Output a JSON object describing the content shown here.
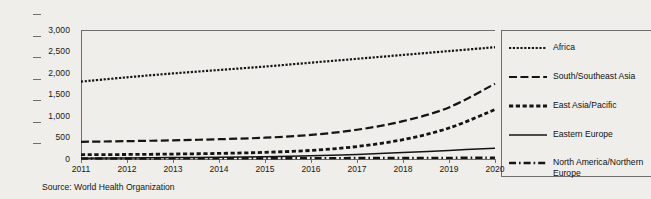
{
  "source_note": "Source: World Health Organization",
  "legend": {
    "items": [
      {
        "label": "Africa",
        "style": "fine-dotted"
      },
      {
        "label": "South/Southeast Asia",
        "style": "long-dashed"
      },
      {
        "label": "East Asia/Pacific",
        "style": "square-dashed"
      },
      {
        "label": "Eastern Europe",
        "style": "solid"
      },
      {
        "label": "North America/Northern\nEurope",
        "style": "dash-dot"
      }
    ]
  },
  "chart_data": {
    "type": "line",
    "title": "",
    "xlabel": "",
    "ylabel": "",
    "grid": false,
    "legend_position": "right",
    "x": [
      2011,
      2012,
      2013,
      2014,
      2015,
      2016,
      2017,
      2018,
      2019,
      2020
    ],
    "xtick_labels": [
      "2011",
      "2012",
      "2013",
      "2014",
      "2015",
      "2016",
      "2017",
      "2018",
      "2019",
      "2020"
    ],
    "ytick_labels": [
      "0",
      "500",
      "1,000",
      "1,500",
      "2,000",
      "2,500",
      "3,000"
    ],
    "ytick_values": [
      0,
      500,
      1000,
      1500,
      2000,
      2500,
      3000
    ],
    "ylim": [
      0,
      3000
    ],
    "xlim": [
      2011,
      2020
    ],
    "series": [
      {
        "name": "Africa",
        "style": "fine-dotted",
        "values": [
          1800,
          1900,
          1990,
          2070,
          2150,
          2240,
          2330,
          2420,
          2510,
          2600
        ]
      },
      {
        "name": "South/Southeast Asia",
        "style": "long-dashed",
        "values": [
          400,
          415,
          435,
          460,
          495,
          560,
          680,
          880,
          1200,
          1750
        ]
      },
      {
        "name": "East Asia/Pacific",
        "style": "square-dashed",
        "values": [
          100,
          105,
          115,
          130,
          155,
          200,
          290,
          450,
          720,
          1150
        ]
      },
      {
        "name": "Eastern Europe",
        "style": "solid",
        "values": [
          20,
          25,
          32,
          42,
          55,
          75,
          105,
          150,
          200,
          250
        ]
      },
      {
        "name": "North America/Northern Europe",
        "style": "dash-dot",
        "values": [
          10,
          12,
          14,
          16,
          18,
          20,
          22,
          24,
          27,
          30
        ]
      }
    ]
  }
}
